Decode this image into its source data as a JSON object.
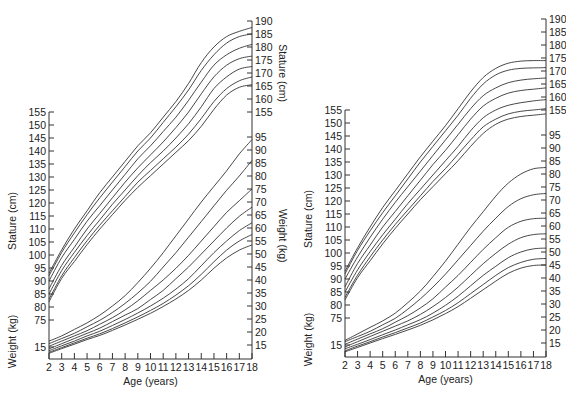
{
  "chart_data": [
    {
      "type": "line",
      "panel": "left",
      "xlabel": "Age (years)",
      "ylabel_left_top": "Stature (cm)",
      "ylabel_left_bottom": "Weight (kg)",
      "ylabel_right_top": "Stature (cm)",
      "ylabel_right_bottom": "Weight (kg)",
      "x_ticks": [
        2,
        3,
        4,
        5,
        6,
        7,
        8,
        9,
        10,
        11,
        12,
        13,
        14,
        15,
        16,
        17,
        18
      ],
      "left_stature_ticks": [
        155,
        150,
        145,
        140,
        135,
        130,
        125,
        120,
        115,
        110,
        105,
        100,
        95,
        90,
        85,
        80,
        75
      ],
      "left_weight_ticks": [
        15
      ],
      "right_stature_ticks": [
        190,
        185,
        180,
        175,
        170,
        165,
        160,
        155
      ],
      "right_weight_ticks": [
        95,
        90,
        85,
        80,
        75,
        70,
        65,
        60,
        55,
        50,
        45,
        40,
        35,
        30,
        25,
        20,
        15
      ],
      "ages": [
        2,
        3,
        4,
        5,
        6,
        7,
        8,
        9,
        10,
        11,
        12,
        13,
        14,
        15,
        16,
        17,
        18
      ],
      "stature_series": [
        {
          "name": "P95",
          "values": [
            93,
            102,
            110,
            117,
            124,
            130,
            136,
            142,
            147,
            153,
            159,
            166,
            174,
            180,
            184,
            186,
            187.5
          ]
        },
        {
          "name": "P90",
          "values": [
            92,
            101,
            108.5,
            115.5,
            122,
            128,
            134,
            140,
            145,
            151,
            157,
            163.5,
            171,
            177,
            181.5,
            184,
            185
          ]
        },
        {
          "name": "P75",
          "values": [
            90,
            99,
            106,
            113,
            119,
            125,
            131,
            137,
            142,
            147.5,
            153,
            159.5,
            166.5,
            173,
            177,
            179.5,
            181
          ]
        },
        {
          "name": "P50",
          "values": [
            87,
            96,
            103,
            110,
            116,
            122,
            128,
            133.5,
            138.5,
            143.5,
            149,
            155,
            162,
            168.5,
            173,
            175.5,
            176.5
          ]
        },
        {
          "name": "P25",
          "values": [
            85,
            94,
            101,
            107.5,
            113.5,
            119.5,
            125,
            130.5,
            135.5,
            140,
            145,
            150.5,
            157,
            164,
            168.5,
            171.5,
            172.5
          ]
        },
        {
          "name": "P10",
          "values": [
            83,
            92,
            99,
            105.5,
            111.5,
            117,
            122.5,
            128,
            132.5,
            137,
            141.5,
            146.5,
            152.5,
            159,
            164,
            167,
            168.5
          ]
        },
        {
          "name": "P5",
          "values": [
            82,
            91,
            97.5,
            104,
            110,
            115.5,
            121,
            126,
            130.5,
            135,
            139.5,
            144,
            149.5,
            156,
            161.5,
            164.5,
            165.5
          ]
        }
      ],
      "weight_series": [
        {
          "name": "P95",
          "values": [
            16.5,
            18.5,
            21,
            23.5,
            26.5,
            30,
            34,
            39,
            44.5,
            50.5,
            57,
            63.5,
            70,
            76,
            82,
            88.5,
            94
          ]
        },
        {
          "name": "P90",
          "values": [
            15.5,
            17.5,
            19.5,
            22,
            24.5,
            27.5,
            31,
            35,
            39.5,
            45,
            50.5,
            56.5,
            62.5,
            68.5,
            74.5,
            80,
            86
          ]
        },
        {
          "name": "P75",
          "values": [
            14.5,
            16.5,
            18.5,
            20.5,
            23,
            25.5,
            28.5,
            32,
            36,
            40,
            44.5,
            49.5,
            55,
            60.5,
            66,
            70.5,
            75
          ]
        },
        {
          "name": "P50",
          "values": [
            13.5,
            15.5,
            17.5,
            19.5,
            21.5,
            24,
            26.5,
            29,
            32.5,
            36,
            40.5,
            45,
            50,
            55,
            60,
            64.5,
            68
          ]
        },
        {
          "name": "P25",
          "values": [
            12.8,
            14.7,
            16.5,
            18.5,
            20.3,
            22.5,
            24.8,
            27.3,
            30,
            33,
            36.5,
            40.5,
            45.5,
            50.5,
            55,
            59,
            62
          ]
        },
        {
          "name": "P10",
          "values": [
            12.2,
            14,
            15.8,
            17.6,
            19.3,
            21.3,
            23.5,
            25.8,
            28.3,
            31,
            34.2,
            37.8,
            42.2,
            47,
            51.5,
            55,
            57.5
          ]
        },
        {
          "name": "P5",
          "values": [
            11.8,
            13.6,
            15.3,
            17.1,
            18.7,
            20.6,
            22.7,
            24.9,
            27.2,
            29.8,
            32.7,
            36,
            40,
            44.5,
            48.5,
            51.5,
            53.5
          ]
        }
      ]
    },
    {
      "type": "line",
      "panel": "right",
      "xlabel": "Age (years)",
      "ylabel_left_top": "Stature (cm)",
      "ylabel_left_bottom": "Weight (kg)",
      "x_ticks": [
        2,
        3,
        4,
        5,
        6,
        7,
        8,
        9,
        10,
        11,
        12,
        13,
        14,
        15,
        16,
        17,
        18
      ],
      "left_stature_ticks": [
        155,
        150,
        145,
        140,
        135,
        130,
        125,
        120,
        115,
        110,
        105,
        100,
        95,
        90,
        85,
        80,
        75
      ],
      "left_weight_ticks": [
        15
      ],
      "right_stature_ticks": [
        190,
        185,
        180,
        175,
        170,
        165,
        160,
        155
      ],
      "right_weight_ticks": [
        95,
        90,
        85,
        80,
        75,
        70,
        65,
        60,
        55,
        50,
        45,
        40,
        35,
        30,
        25,
        20,
        15
      ],
      "ages": [
        2,
        3,
        4,
        5,
        6,
        7,
        8,
        9,
        10,
        11,
        12,
        13,
        14,
        15,
        16,
        17,
        18
      ],
      "stature_series": [
        {
          "name": "P95",
          "values": [
            93,
            102,
            110,
            117.5,
            124,
            130.5,
            137,
            143,
            149,
            155.5,
            162,
            167.5,
            171,
            173,
            173.8,
            174,
            174
          ]
        },
        {
          "name": "P90",
          "values": [
            92,
            101,
            108.5,
            115.5,
            122,
            128.5,
            135,
            141,
            147,
            153,
            159.5,
            165,
            168.5,
            170.3,
            171,
            171.2,
            171.3
          ]
        },
        {
          "name": "P75",
          "values": [
            90,
            98.5,
            106,
            113,
            119.5,
            125.5,
            131.5,
            137.5,
            143.5,
            149.5,
            155.5,
            160.5,
            163.5,
            165.5,
            166.5,
            167,
            167.3
          ]
        },
        {
          "name": "P50",
          "values": [
            87,
            96,
            103,
            110,
            116,
            122,
            128,
            134,
            139.5,
            145.5,
            151.5,
            156.5,
            159.5,
            161.5,
            162.5,
            163,
            163.5
          ]
        },
        {
          "name": "P25",
          "values": [
            85,
            93.5,
            100.5,
            107,
            113,
            119,
            124.5,
            130,
            135.5,
            141,
            147,
            152,
            155,
            156.8,
            157.8,
            158.5,
            159
          ]
        },
        {
          "name": "P10",
          "values": [
            83,
            91.5,
            98.5,
            105,
            111,
            116.5,
            122,
            127.5,
            132.5,
            138,
            143.5,
            148.5,
            151.5,
            153.5,
            154.5,
            155,
            155.5
          ]
        },
        {
          "name": "P5",
          "values": [
            82,
            90.5,
            97,
            103.5,
            109.5,
            115,
            120.5,
            125.5,
            130.5,
            135.5,
            141,
            146,
            149.5,
            151.5,
            152.5,
            153,
            153.5
          ]
        }
      ],
      "weight_series": [
        {
          "name": "P95",
          "values": [
            16,
            18.5,
            21,
            23.5,
            26.5,
            30.5,
            35,
            40.5,
            46.5,
            53,
            59.5,
            65.5,
            71.5,
            76.5,
            80,
            82,
            82.5
          ]
        },
        {
          "name": "P90",
          "values": [
            15.5,
            17.5,
            19.5,
            22,
            24.5,
            28,
            32,
            36.5,
            41.5,
            47,
            52.5,
            58,
            63,
            67.5,
            70.5,
            72,
            72.5
          ]
        },
        {
          "name": "P75",
          "values": [
            14.5,
            16.5,
            18.5,
            20.5,
            23,
            25.5,
            28.5,
            32,
            36.5,
            41,
            46,
            51,
            55.5,
            59.5,
            61.8,
            62.8,
            63
          ]
        },
        {
          "name": "P50",
          "values": [
            13.5,
            15.5,
            17.5,
            19.5,
            21.5,
            23.5,
            26,
            29,
            32.5,
            36.5,
            41,
            45.5,
            49.5,
            53,
            55.5,
            56.7,
            57
          ]
        },
        {
          "name": "P25",
          "values": [
            12.8,
            14.5,
            16.3,
            18.2,
            20,
            22,
            24,
            26.5,
            29.5,
            33,
            37,
            41,
            44.5,
            47.8,
            50,
            51.2,
            51.5
          ]
        },
        {
          "name": "P10",
          "values": [
            12,
            13.8,
            15.5,
            17.3,
            19,
            20.8,
            22.7,
            25,
            27.5,
            30.5,
            34,
            37.5,
            41,
            44,
            46,
            47.2,
            47.5
          ]
        },
        {
          "name": "P5",
          "values": [
            11.6,
            13.3,
            15,
            16.7,
            18.3,
            20,
            21.8,
            23.9,
            26.3,
            29,
            32.2,
            35.5,
            38.8,
            41.8,
            43.8,
            44.8,
            45
          ]
        }
      ]
    }
  ]
}
